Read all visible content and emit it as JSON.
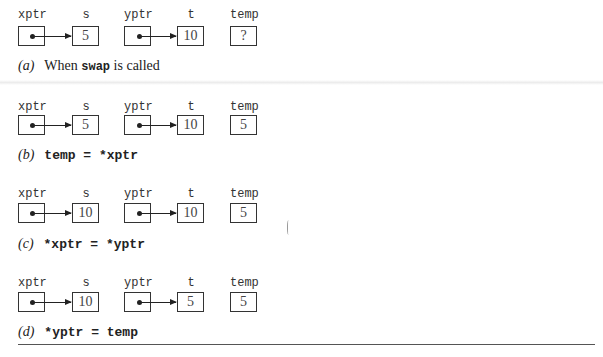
{
  "figure": {
    "variable_labels": [
      "xptr",
      "s",
      "yptr",
      "t",
      "temp"
    ],
    "panels": [
      {
        "id": "a",
        "tag": "(a)",
        "caption_pre": "When ",
        "caption_code": "swap",
        "caption_post": " is called",
        "values": {
          "s": "5",
          "t": "10",
          "temp": "?"
        }
      },
      {
        "id": "b",
        "tag": "(b)",
        "caption_code": "temp = *xptr",
        "values": {
          "s": "5",
          "t": "10",
          "temp": "5"
        }
      },
      {
        "id": "c",
        "tag": "(c)",
        "caption_code": "*xptr = *yptr",
        "values": {
          "s": "10",
          "t": "10",
          "temp": "5"
        }
      },
      {
        "id": "d",
        "tag": "(d)",
        "caption_code": "*yptr = temp",
        "values": {
          "s": "10",
          "t": "5",
          "temp": "5"
        }
      }
    ]
  }
}
